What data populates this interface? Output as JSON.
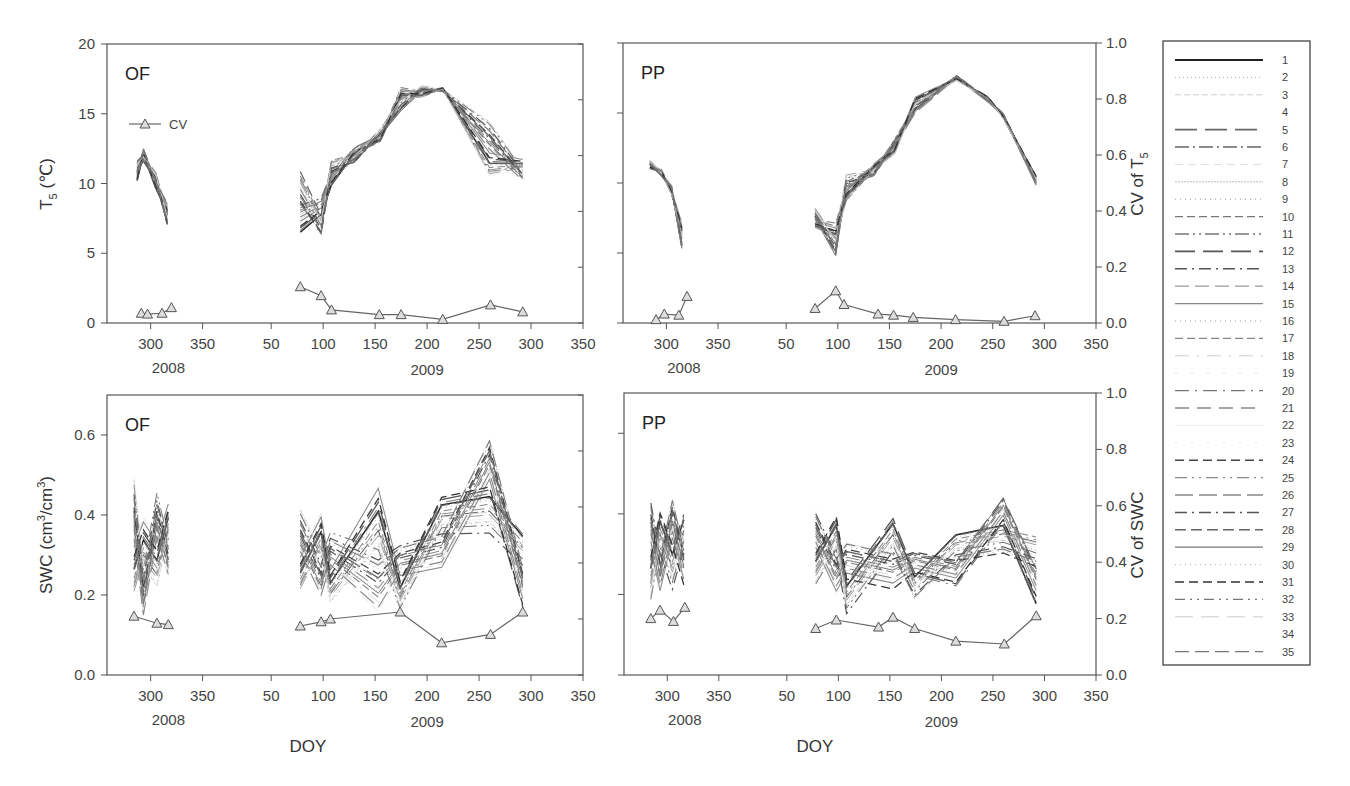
{
  "figure": {
    "xlabel": "DOY",
    "years": [
      "2008",
      "2009"
    ],
    "cv_legend_label": "CV",
    "right_axis_top": "CV of T5",
    "right_axis_bottom": "CV of SWC",
    "left_axis_top": "T5 (℃)",
    "left_axis_bottom": "SWC (cm3/cm3)"
  },
  "chart_data": [
    {
      "type": "line",
      "panel": "top-left",
      "tag": "OF",
      "title": "",
      "xlabel": "",
      "ylabel": "T5 (℃)",
      "ylim": [
        0,
        20
      ],
      "yticks": [
        0,
        5,
        10,
        15,
        20
      ],
      "y2label": "",
      "y2lim": [
        0,
        1.0
      ],
      "xticks_2008": [
        300,
        350
      ],
      "xticks_2009": [
        50,
        100,
        150,
        200,
        250,
        300,
        350
      ],
      "series_envelope": {
        "2008": {
          "x": [
            287,
            293,
            305,
            316
          ],
          "low": [
            10.2,
            11.6,
            9.6,
            7.0
          ],
          "high": [
            11.6,
            12.5,
            10.8,
            8.6
          ]
        },
        "2009": {
          "x": [
            78,
            98,
            108,
            130,
            155,
            175,
            195,
            215,
            260,
            292
          ],
          "low": [
            6.5,
            6.4,
            9.8,
            11.5,
            13.0,
            15.2,
            16.2,
            16.6,
            10.5,
            10.2
          ],
          "high": [
            10.9,
            9.0,
            11.7,
            12.6,
            13.9,
            16.9,
            17.0,
            16.9,
            14.5,
            11.8
          ]
        }
      },
      "cv_series": {
        "name": "CV",
        "x_2008": [
          291,
          297,
          311,
          320
        ],
        "y_2008": [
          0.035,
          0.032,
          0.035,
          0.055
        ],
        "x_2009": [
          78,
          98,
          108,
          154,
          175,
          215,
          261,
          292
        ],
        "y_2009": [
          0.13,
          0.098,
          0.047,
          0.03,
          0.03,
          0.013,
          0.065,
          0.04
        ]
      },
      "legend": [
        "CV"
      ]
    },
    {
      "type": "line",
      "panel": "top-right",
      "tag": "PP",
      "ylabel": "",
      "ylim": [
        0,
        20
      ],
      "y2label": "CV of T5",
      "y2lim": [
        0,
        1.0
      ],
      "y2ticks": [
        0.0,
        0.2,
        0.4,
        0.6,
        0.8,
        1.0
      ],
      "xticks_2008": [
        300,
        350
      ],
      "xticks_2009": [
        50,
        100,
        150,
        200,
        250,
        300,
        350
      ],
      "series_envelope": {
        "2008": {
          "x": [
            284,
            295,
            305,
            315
          ],
          "low": [
            11.0,
            10.5,
            9.2,
            5.2
          ],
          "high": [
            11.6,
            11.0,
            9.9,
            7.2
          ]
        },
        "2009": {
          "x": [
            78,
            98,
            108,
            135,
            155,
            175,
            215,
            245,
            260,
            292
          ],
          "low": [
            6.8,
            4.8,
            8.7,
            10.5,
            12.0,
            15.0,
            17.3,
            15.8,
            14.6,
            9.8
          ],
          "high": [
            8.2,
            7.2,
            10.6,
            11.4,
            13.2,
            16.2,
            17.7,
            16.2,
            15.0,
            10.5
          ]
        }
      },
      "cv_series": {
        "name": "CV",
        "x_2008": [
          290,
          298,
          312,
          320
        ],
        "y_2008": [
          0.012,
          0.032,
          0.028,
          0.095
        ],
        "x_2009": [
          78,
          98,
          106,
          139,
          154,
          173,
          214,
          261,
          291
        ],
        "y_2009": [
          0.052,
          0.115,
          0.066,
          0.032,
          0.028,
          0.02,
          0.012,
          0.006,
          0.026
        ]
      }
    },
    {
      "type": "line",
      "panel": "bottom-left",
      "tag": "OF",
      "xlabel": "DOY",
      "ylabel": "SWC (cm3/cm3)",
      "ylim": [
        0,
        0.7
      ],
      "yticks": [
        0.0,
        0.2,
        0.4,
        0.6
      ],
      "y2lim": [
        0,
        1.0
      ],
      "xticks_2008": [
        300,
        350
      ],
      "xticks_2009": [
        50,
        100,
        150,
        200,
        250,
        300,
        350
      ],
      "series_envelope": {
        "2008": {
          "x": [
            284,
            293,
            306,
            317
          ],
          "low": [
            0.2,
            0.15,
            0.22,
            0.24
          ],
          "high": [
            0.5,
            0.4,
            0.46,
            0.43
          ]
        },
        "2009": {
          "x": [
            78,
            98,
            107,
            153,
            174,
            214,
            260,
            292
          ],
          "low": [
            0.21,
            0.2,
            0.18,
            0.15,
            0.16,
            0.26,
            0.35,
            0.17
          ],
          "high": [
            0.42,
            0.41,
            0.36,
            0.47,
            0.33,
            0.45,
            0.59,
            0.36
          ]
        }
      },
      "cv_series": {
        "name": "CV",
        "x_2008": [
          284,
          306,
          317
        ],
        "y_2008": [
          0.21,
          0.185,
          0.18
        ],
        "x_2009": [
          78,
          98,
          107,
          174,
          214,
          261,
          292
        ],
        "y_2009": [
          0.175,
          0.19,
          0.2,
          0.225,
          0.115,
          0.145,
          0.225
        ]
      }
    },
    {
      "type": "line",
      "panel": "bottom-right",
      "tag": "PP",
      "xlabel": "DOY",
      "ylim": [
        0,
        0.7
      ],
      "y2label": "CV of SWC",
      "y2lim": [
        0,
        1.0
      ],
      "y2ticks": [
        0.0,
        0.2,
        0.4,
        0.6,
        0.8,
        1.0
      ],
      "xticks_2008": [
        300,
        350
      ],
      "xticks_2009": [
        50,
        100,
        150,
        200,
        250,
        300,
        350
      ],
      "series_envelope": {
        "2008": {
          "x": [
            284,
            293,
            305,
            316
          ],
          "low": [
            0.18,
            0.2,
            0.21,
            0.22
          ],
          "high": [
            0.44,
            0.41,
            0.44,
            0.4
          ]
        },
        "2009": {
          "x": [
            78,
            98,
            108,
            153,
            174,
            214,
            260,
            292
          ],
          "low": [
            0.22,
            0.2,
            0.15,
            0.21,
            0.19,
            0.22,
            0.3,
            0.17
          ],
          "high": [
            0.41,
            0.4,
            0.33,
            0.39,
            0.31,
            0.35,
            0.44,
            0.35
          ]
        }
      },
      "cv_series": {
        "name": "CV",
        "x_2008": [
          284,
          293,
          306,
          317
        ],
        "y_2008": [
          0.2,
          0.23,
          0.19,
          0.24
        ],
        "x_2009": [
          78,
          98,
          139,
          153,
          174,
          214,
          261,
          292
        ],
        "y_2009": [
          0.165,
          0.195,
          0.17,
          0.205,
          0.165,
          0.12,
          0.11,
          0.21
        ]
      }
    }
  ],
  "legend": {
    "entries": [
      "1",
      "2",
      "3",
      "4",
      "5",
      "6",
      "7",
      "8",
      "9",
      "10",
      "11",
      "12",
      "13",
      "14",
      "15",
      "16",
      "17",
      "18",
      "19",
      "20",
      "21",
      "22",
      "23",
      "24",
      "25",
      "26",
      "27",
      "28",
      "29",
      "30",
      "31",
      "32",
      "33",
      "34",
      "35"
    ],
    "styles": [
      {
        "dash": "",
        "color": "#222222",
        "width": 1.8
      },
      {
        "dash": "1 3",
        "color": "#aaaaaa",
        "width": 1
      },
      {
        "dash": "6 3",
        "color": "#cccccc",
        "width": 1
      },
      {
        "dash": "",
        "color": "#ffffff",
        "width": 1
      },
      {
        "dash": "22 8",
        "color": "#666666",
        "width": 1.6
      },
      {
        "dash": "14 4 2 4",
        "color": "#666666",
        "width": 1.4
      },
      {
        "dash": "8 5",
        "color": "#dddddd",
        "width": 1
      },
      {
        "dash": "2 1",
        "color": "#bbbbbb",
        "width": 1
      },
      {
        "dash": "1 4",
        "color": "#999999",
        "width": 1
      },
      {
        "dash": "8 4",
        "color": "#777777",
        "width": 1.3
      },
      {
        "dash": "14 4 2 4 2 4",
        "color": "#777777",
        "width": 1.3
      },
      {
        "dash": "20 8",
        "color": "#555555",
        "width": 1.6
      },
      {
        "dash": "12 5 2 5",
        "color": "#555555",
        "width": 1.5
      },
      {
        "dash": "14 6",
        "color": "#999999",
        "width": 1.2
      },
      {
        "dash": "",
        "color": "#888888",
        "width": 1.3
      },
      {
        "dash": "1 4",
        "color": "#999999",
        "width": 1
      },
      {
        "dash": "8 4",
        "color": "#888888",
        "width": 1.3
      },
      {
        "dash": "14 8 2 8",
        "color": "#cccccc",
        "width": 1
      },
      {
        "dash": "2 14",
        "color": "#dddddd",
        "width": 1
      },
      {
        "dash": "14 6 2 6",
        "color": "#777777",
        "width": 1.3
      },
      {
        "dash": "14 8",
        "color": "#888888",
        "width": 1.3
      },
      {
        "dash": "",
        "color": "#eeeeee",
        "width": 1
      },
      {
        "dash": "2 14",
        "color": "#e0e0e0",
        "width": 1
      },
      {
        "dash": "9 5",
        "color": "#444444",
        "width": 1.6
      },
      {
        "dash": "12 5 2 5 2 5",
        "color": "#888888",
        "width": 1.2
      },
      {
        "dash": "18 6",
        "color": "#888888",
        "width": 1.4
      },
      {
        "dash": "12 5 2 5",
        "color": "#555555",
        "width": 1.5
      },
      {
        "dash": "11 5",
        "color": "#666666",
        "width": 1.5
      },
      {
        "dash": "",
        "color": "#777777",
        "width": 1.2
      },
      {
        "dash": "1 4",
        "color": "#aaaaaa",
        "width": 1
      },
      {
        "dash": "9 5",
        "color": "#333333",
        "width": 1.6
      },
      {
        "dash": "10 5 2 5 2 5",
        "color": "#777777",
        "width": 1.2
      },
      {
        "dash": "18 8",
        "color": "#cccccc",
        "width": 1
      },
      {
        "dash": "",
        "color": "#ffffff",
        "width": 1
      },
      {
        "dash": "14 6",
        "color": "#777777",
        "width": 1.3
      }
    ]
  },
  "colors": {
    "axis": "#555555",
    "cv_line": "#666666",
    "cv_marker_fill": "#dddddd",
    "series_dark": "#333333",
    "series_light": "#bbbbbb"
  }
}
